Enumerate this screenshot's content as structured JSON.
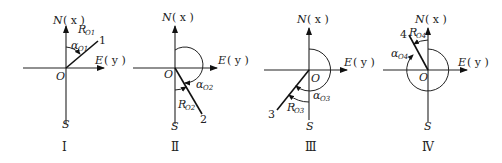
{
  "figure": {
    "axis_labels": {
      "north": "N",
      "north_paren": "( x )",
      "east": "E",
      "east_paren": "( y )",
      "south": "S",
      "origin": "O"
    },
    "panels": [
      {
        "id": "I",
        "roman": "Ⅰ",
        "line_label": "1",
        "alpha_label": "α",
        "alpha_sub": "O1",
        "r_label": "R",
        "r_sub": "O1",
        "line_azimuth_deg": 35
      },
      {
        "id": "II",
        "roman": "Ⅱ",
        "line_label": "2",
        "alpha_label": "α",
        "alpha_sub": "O2",
        "r_label": "R",
        "r_sub": "O2",
        "line_azimuth_deg": 150
      },
      {
        "id": "III",
        "roman": "Ⅲ",
        "line_label": "3",
        "alpha_label": "α",
        "alpha_sub": "O3",
        "r_label": "R",
        "r_sub": "O3",
        "line_azimuth_deg": 218
      },
      {
        "id": "IV",
        "roman": "Ⅳ",
        "line_label": "4",
        "alpha_label": "α",
        "alpha_sub": "O4",
        "r_label": "R",
        "r_sub": "O4",
        "line_azimuth_deg": 330
      }
    ]
  }
}
